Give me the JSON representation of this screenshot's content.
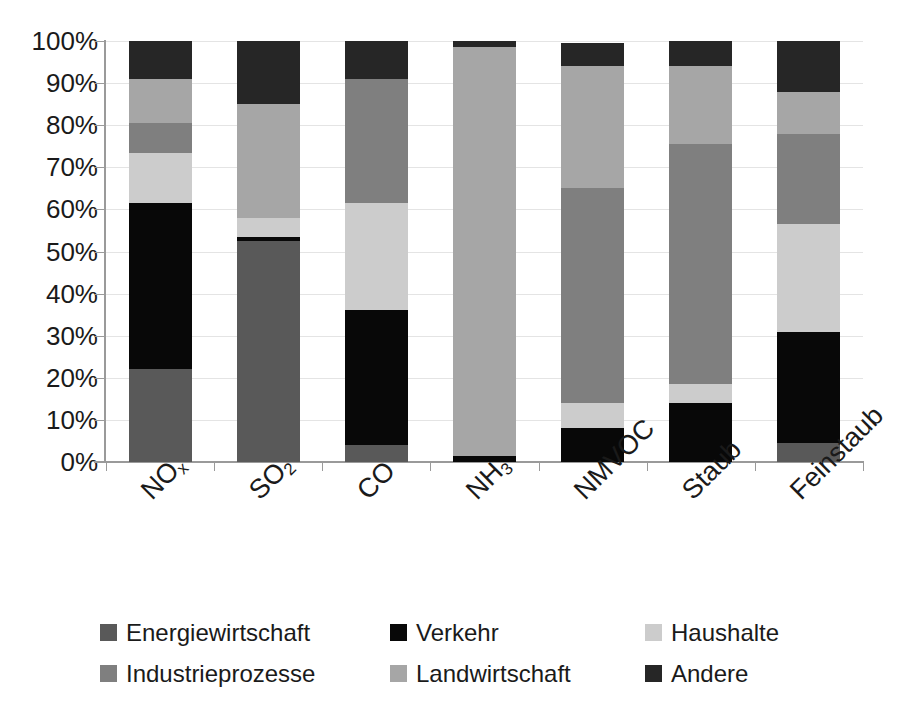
{
  "chart_data": {
    "type": "bar",
    "stacked": true,
    "normalized": true,
    "title": "",
    "xlabel": "",
    "ylabel": "",
    "ylim": [
      0,
      100
    ],
    "ytick_labels": [
      "100%",
      "90%",
      "80%",
      "70%",
      "60%",
      "50%",
      "40%",
      "30%",
      "20%",
      "10%",
      "0%"
    ],
    "ytick_values": [
      100,
      90,
      80,
      70,
      60,
      50,
      40,
      30,
      20,
      10,
      0
    ],
    "grid": true,
    "legend_position": "bottom",
    "categories": [
      "NOx",
      "SO2",
      "CO",
      "NH3",
      "NMVOC",
      "Staub",
      "Feinstaub"
    ],
    "category_labels": [
      {
        "base": "NO",
        "sub": "x"
      },
      {
        "base": "SO",
        "sub": "2"
      },
      {
        "base": "CO",
        "sub": ""
      },
      {
        "base": "NH",
        "sub": "3"
      },
      {
        "base": "NMVOC",
        "sub": ""
      },
      {
        "base": "Staub",
        "sub": ""
      },
      {
        "base": "Feinstaub",
        "sub": ""
      }
    ],
    "series": [
      {
        "name": "Energiewirtschaft",
        "color": "#595959",
        "values": [
          22.0,
          52.5,
          4.0,
          0.0,
          0.0,
          0.0,
          4.5
        ]
      },
      {
        "name": "Verkehr",
        "color": "#080808",
        "values": [
          39.5,
          1.0,
          32.0,
          1.5,
          8.0,
          14.0,
          26.5
        ]
      },
      {
        "name": "Haushalte",
        "color": "#cccccc",
        "values": [
          12.0,
          4.5,
          25.5,
          0.0,
          6.0,
          4.5,
          25.5
        ]
      },
      {
        "name": "Industrieprozesse",
        "color": "#7f7f7f",
        "values": [
          7.0,
          0.0,
          29.5,
          0.0,
          51.0,
          57.0,
          21.5
        ]
      },
      {
        "name": "Landwirtschaft",
        "color": "#a6a6a6",
        "values": [
          10.5,
          27.0,
          0.0,
          97.0,
          29.0,
          18.5,
          10.0
        ]
      },
      {
        "name": "Andere",
        "color": "#262626",
        "values": [
          9.0,
          15.0,
          9.0,
          1.5,
          5.5,
          6.0,
          12.0
        ]
      }
    ]
  },
  "legend": {
    "items": [
      {
        "label": "Energiewirtschaft",
        "color": "#595959"
      },
      {
        "label": "Verkehr",
        "color": "#080808"
      },
      {
        "label": "Haushalte",
        "color": "#cccccc"
      },
      {
        "label": "Industrieprozesse",
        "color": "#7f7f7f"
      },
      {
        "label": "Landwirtschaft",
        "color": "#a6a6a6"
      },
      {
        "label": "Andere",
        "color": "#262626"
      }
    ]
  },
  "title_remnant": ""
}
